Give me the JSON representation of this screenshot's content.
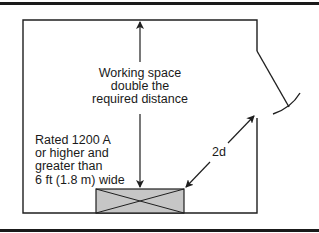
{
  "diagram": {
    "colors": {
      "line": "#1f1f1f",
      "rule": "#1a1a1a",
      "equipment_fill": "#c6c6c6",
      "background": "#ffffff"
    },
    "working_space_label": {
      "line1": "Working space",
      "line2": "double the",
      "line3": "required distance"
    },
    "equipment_label": {
      "line1": "Rated 1200 A",
      "line2": "or higher and",
      "line3": "greater than",
      "line4": "6 ft (1.8 m) wide"
    },
    "distance_label": "2d"
  }
}
